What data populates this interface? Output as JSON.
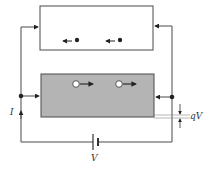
{
  "diagram": {
    "title": "",
    "colors": {
      "line": "#4a4a4a",
      "top_box_fill": "#ffffff",
      "bottom_box_fill": "#b4b4b4",
      "particle": "#222222",
      "hole_fill": "#ffffff"
    },
    "top_box": {
      "label": "",
      "carriers": [
        {
          "type": "electron",
          "direction": "left"
        },
        {
          "type": "electron",
          "direction": "left"
        }
      ]
    },
    "bottom_box": {
      "label": "",
      "carriers": [
        {
          "type": "hole",
          "direction": "right"
        },
        {
          "type": "hole",
          "direction": "right"
        }
      ]
    },
    "labels": {
      "current": "I",
      "voltage": "V",
      "energy_shift": "qV"
    },
    "components": {
      "battery": "battery-symbol",
      "junctions": 2
    }
  }
}
